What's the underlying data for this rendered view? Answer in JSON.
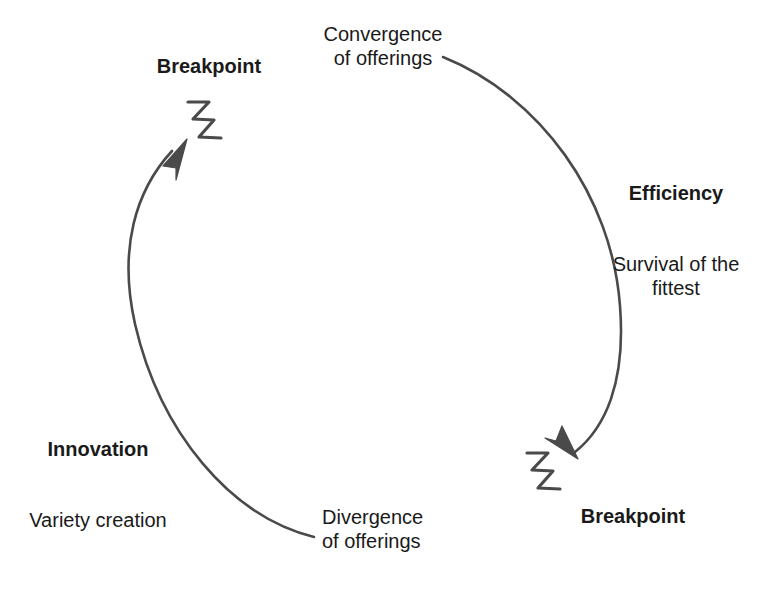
{
  "diagram": {
    "stroke_color": "#4a4a4a",
    "text_color": "#1a1a1a",
    "background_color": "#ffffff",
    "labels": {
      "breakpoint_top": "Breakpoint",
      "breakpoint_bottom": "Breakpoint",
      "convergence": "Convergence\nof offerings",
      "divergence": "Divergence\nof offerings",
      "efficiency_title": "Efficiency",
      "efficiency_sub": "Survival of the\nfittest",
      "innovation_title": "Innovation",
      "innovation_sub": "Variety creation"
    },
    "icons": {
      "lightning_top": "lightning-bolt-icon",
      "lightning_bottom": "lightning-bolt-icon",
      "arrow_up": "arrowhead-up-icon",
      "arrow_down": "arrowhead-down-icon"
    }
  }
}
